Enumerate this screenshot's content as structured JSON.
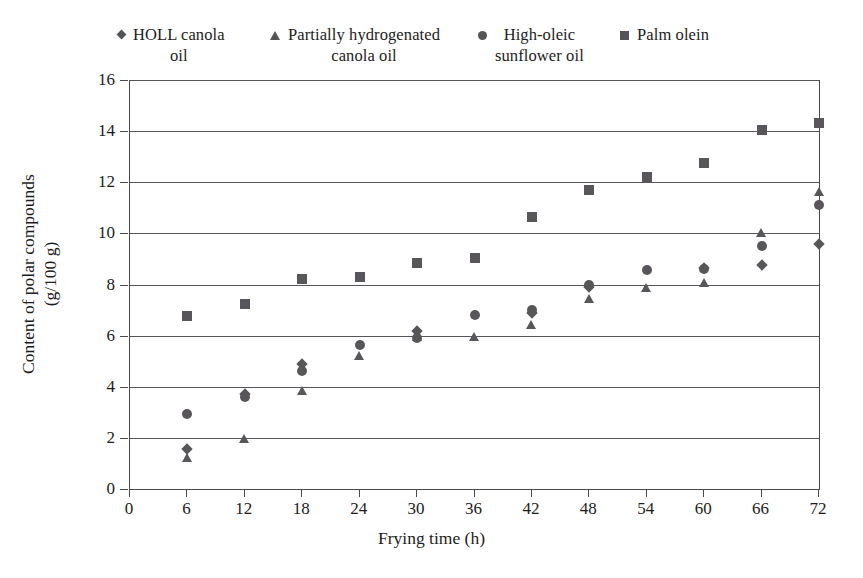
{
  "chart_data": {
    "type": "scatter",
    "title": "",
    "xlabel": "Frying time (h)",
    "ylabel": "Content of polar compounds\n(g/100 g)",
    "xlim": [
      0,
      72
    ],
    "ylim": [
      0,
      16
    ],
    "xticks": [
      0,
      6,
      12,
      18,
      24,
      30,
      36,
      42,
      48,
      54,
      60,
      66,
      72
    ],
    "yticks": [
      0,
      2,
      4,
      6,
      8,
      10,
      12,
      14,
      16
    ],
    "grid": "horizontal",
    "legend_position": "top",
    "x": [
      6,
      12,
      18,
      24,
      30,
      36,
      42,
      48,
      54,
      60,
      66,
      72
    ],
    "series": [
      {
        "name": "HOLL canola\noil",
        "marker": "diamond",
        "color": "#58565b",
        "values": [
          1.55,
          3.7,
          4.9,
          null,
          6.2,
          null,
          6.9,
          7.9,
          null,
          8.65,
          8.75,
          9.6
        ]
      },
      {
        "name": "Partially hydrogenated\ncanola oil",
        "marker": "triangle",
        "color": "#58565b",
        "values": [
          1.2,
          1.95,
          3.85,
          5.2,
          5.95,
          5.95,
          6.4,
          7.45,
          7.85,
          8.05,
          10.0,
          11.6
        ]
      },
      {
        "name": "High-oleic\nsunflower oil",
        "marker": "circle",
        "color": "#58565b",
        "values": [
          2.95,
          3.6,
          4.6,
          5.65,
          5.9,
          6.8,
          7.0,
          8.0,
          8.55,
          8.6,
          9.5,
          11.1
        ]
      },
      {
        "name": "Palm olein",
        "marker": "square",
        "color": "#58565b",
        "values": [
          6.75,
          7.25,
          8.2,
          8.3,
          8.85,
          9.05,
          10.65,
          11.7,
          12.2,
          12.75,
          14.05,
          14.3
        ]
      }
    ]
  },
  "legend": {
    "entries": [
      {
        "label": "HOLL canola\noil",
        "marker": "diamond"
      },
      {
        "label": "Partially hydrogenated\ncanola oil",
        "marker": "triangle"
      },
      {
        "label": "High-oleic\nsunflower oil",
        "marker": "circle"
      },
      {
        "label": "Palm olein",
        "marker": "square"
      }
    ]
  },
  "axes": {
    "x_title": "Frying time (h)",
    "y_title": "Content of polar compounds\n(g/100 g)",
    "x_tick_labels": [
      "0",
      "6",
      "12",
      "18",
      "24",
      "30",
      "36",
      "42",
      "48",
      "54",
      "60",
      "66",
      "72"
    ],
    "y_tick_labels": [
      "0",
      "2",
      "4",
      "6",
      "8",
      "10",
      "12",
      "14",
      "16"
    ]
  },
  "colors": {
    "marker": "#58565b",
    "gridline": "#55555a",
    "axis": "#4a4a4a",
    "text": "#1c1c1c",
    "background": "#ffffff"
  }
}
